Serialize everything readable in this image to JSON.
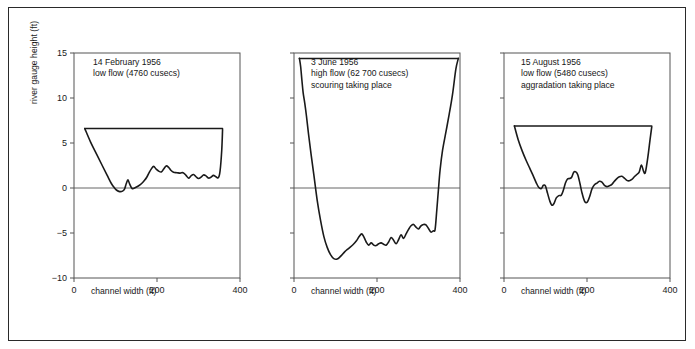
{
  "figure": {
    "width": 695,
    "height": 349,
    "background": "#ffffff",
    "border_color": "#2a2a2a",
    "line_color": "#1a1a1a",
    "axis_color": "#555555"
  },
  "axes": {
    "x_label": "channel width (ft)",
    "y_label": "river gauge height (ft)",
    "x_ticks": [
      0,
      200,
      400
    ],
    "x_tick_labels": [
      "0",
      "200",
      "400"
    ],
    "y_ticks": [
      -10,
      -5,
      0,
      5,
      10,
      15
    ],
    "y_tick_labels": [
      "−10",
      "−5",
      "0",
      "5",
      "10",
      "15"
    ],
    "xlim": [
      0,
      400
    ],
    "ylim": [
      -10,
      15
    ],
    "zero_line": true,
    "grid": false
  },
  "chart_data": {
    "type": "line",
    "title": "",
    "xlabel": "channel width (ft)",
    "ylabel": "river gauge height (ft)",
    "xlim": [
      0,
      400
    ],
    "ylim": [
      -10,
      15
    ],
    "panels": [
      {
        "id": "panel-feb",
        "date": "14 February 1956",
        "flow_text": "low flow (4760 cusecs)",
        "note": "",
        "water_surface_height": 6.6,
        "water_left_x": 26,
        "water_right_x": 358,
        "bed_x": [
          26,
          40,
          55,
          68,
          80,
          90,
          97,
          103,
          110,
          117,
          122,
          126,
          130,
          134,
          140,
          148,
          156,
          163,
          170,
          176,
          181,
          186,
          192,
          198,
          205,
          211,
          216,
          222,
          228,
          234,
          240,
          248,
          256,
          263,
          270,
          276,
          282,
          288,
          294,
          300,
          306,
          312,
          318,
          324,
          330,
          336,
          342,
          348,
          352,
          356,
          358
        ],
        "bed_y": [
          6.6,
          5.1,
          3.7,
          2.5,
          1.4,
          0.5,
          0.05,
          -0.25,
          -0.4,
          -0.35,
          -0.1,
          0.5,
          0.9,
          0.45,
          -0.05,
          0.05,
          0.25,
          0.5,
          0.85,
          1.25,
          1.7,
          2.1,
          2.4,
          2.1,
          1.85,
          1.8,
          2.1,
          2.45,
          2.3,
          1.95,
          1.75,
          1.7,
          1.65,
          1.7,
          1.4,
          1.1,
          1.35,
          1.5,
          1.25,
          1.05,
          1.2,
          1.45,
          1.35,
          1.1,
          1.2,
          1.4,
          1.25,
          1.15,
          1.9,
          4.2,
          6.5
        ]
      },
      {
        "id": "panel-jun",
        "date": "3 June 1956",
        "flow_text": "high flow (62 700 cusecs)",
        "note": "scouring taking place",
        "water_surface_height": 14.4,
        "water_left_x": 13,
        "water_right_x": 396,
        "bed_x": [
          13,
          16,
          19,
          22,
          26,
          30,
          35,
          41,
          48,
          56,
          64,
          72,
          80,
          88,
          96,
          104,
          112,
          122,
          132,
          142,
          150,
          157,
          163,
          168,
          174,
          180,
          186,
          192,
          198,
          204,
          210,
          216,
          222,
          228,
          234,
          240,
          246,
          252,
          258,
          264,
          270,
          276,
          282,
          288,
          294,
          300,
          306,
          312,
          318,
          324,
          330,
          336,
          340,
          344,
          348,
          352,
          358,
          366,
          374,
          382,
          390,
          396
        ],
        "bed_y": [
          14.4,
          13.5,
          12.0,
          10.6,
          9.4,
          8.0,
          6.0,
          3.8,
          1.4,
          -1.4,
          -3.6,
          -5.4,
          -6.6,
          -7.4,
          -7.85,
          -7.9,
          -7.6,
          -7.1,
          -6.7,
          -6.3,
          -5.9,
          -5.4,
          -5.1,
          -5.4,
          -6.0,
          -6.35,
          -6.1,
          -6.35,
          -6.4,
          -6.2,
          -6.1,
          -6.25,
          -6.35,
          -6.0,
          -5.5,
          -5.8,
          -6.2,
          -5.75,
          -5.2,
          -5.6,
          -5.1,
          -4.6,
          -4.2,
          -4.05,
          -4.35,
          -4.55,
          -4.2,
          -4.05,
          -4.1,
          -4.5,
          -4.9,
          -4.75,
          -4.6,
          -2.5,
          -0.2,
          2.0,
          4.2,
          6.2,
          8.2,
          10.4,
          13.2,
          14.4
        ]
      },
      {
        "id": "panel-aug",
        "date": "15 August 1956",
        "flow_text": "low flow (5480 cusecs)",
        "note": "aggradation taking place",
        "water_surface_height": 6.9,
        "water_left_x": 25,
        "water_right_x": 356,
        "bed_x": [
          25,
          34,
          44,
          54,
          62,
          70,
          78,
          84,
          90,
          95,
          100,
          105,
          110,
          115,
          120,
          126,
          132,
          138,
          143,
          148,
          153,
          158,
          163,
          168,
          173,
          178,
          183,
          188,
          194,
          200,
          206,
          212,
          218,
          224,
          230,
          236,
          242,
          248,
          254,
          260,
          266,
          272,
          278,
          284,
          290,
          296,
          302,
          308,
          314,
          320,
          326,
          331,
          336,
          340,
          344,
          348,
          352,
          356
        ],
        "bed_y": [
          6.9,
          5.4,
          4.1,
          3.0,
          2.2,
          1.4,
          0.55,
          0.05,
          -0.05,
          0.3,
          0.2,
          -0.6,
          -1.4,
          -1.9,
          -1.75,
          -1.1,
          -0.85,
          -0.8,
          -0.25,
          0.55,
          1.0,
          1.05,
          1.2,
          1.75,
          1.8,
          1.45,
          0.5,
          -0.55,
          -1.45,
          -1.6,
          -1.0,
          -0.1,
          0.35,
          0.55,
          0.75,
          0.65,
          0.3,
          0.15,
          0.25,
          0.4,
          0.75,
          1.05,
          1.25,
          1.3,
          1.1,
          0.85,
          0.8,
          0.95,
          1.25,
          1.5,
          1.8,
          2.55,
          1.9,
          1.65,
          2.6,
          3.9,
          5.4,
          6.8
        ]
      }
    ]
  }
}
